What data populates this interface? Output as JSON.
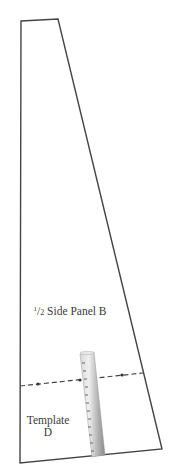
{
  "diagram": {
    "type": "sewing-pattern-template",
    "panel": {
      "shape": "trapezoid",
      "corners": [
        [
          21,
          21
        ],
        [
          58,
          19
        ],
        [
          162,
          449
        ],
        [
          20,
          463
        ]
      ],
      "stroke_color": "#444444"
    },
    "labels": {
      "panel_fraction": "1/2",
      "panel_name": "Side Panel B",
      "panel_full": "½ Side Panel B",
      "template_line1": "Template",
      "template_line2": "D"
    },
    "dashed_line": {
      "from": [
        20,
        386
      ],
      "to": [
        143,
        373
      ],
      "markers": [
        [
          38,
          384
        ],
        [
          80,
          380
        ],
        [
          122,
          375
        ]
      ],
      "color": "#444444"
    },
    "ruler": {
      "icon": "ruler-icon",
      "color_light": "#e6e6e6",
      "color_dark": "#8a8a8a",
      "tick_count": 12
    }
  }
}
